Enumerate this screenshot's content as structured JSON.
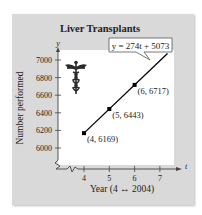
{
  "chart_data": {
    "type": "line",
    "title": "Liver Transplants",
    "xlabel": "Year (4 ↔ 2004)",
    "ylabel": "Number performed",
    "x_axis_var": "t",
    "y_axis_var": "y",
    "x_ticks": [
      "4",
      "5",
      "6",
      "7"
    ],
    "y_ticks": [
      "6000",
      "6200",
      "6400",
      "6600",
      "6800",
      "7000"
    ],
    "xlim": [
      3.1,
      7.5
    ],
    "ylim": [
      5900,
      7150
    ],
    "equation_label": "y = 274t + 5073",
    "series": [
      {
        "name": "Number performed",
        "x": [
          4,
          5,
          6
        ],
        "values": [
          6169,
          6443,
          6717
        ],
        "point_labels": [
          "(4, 6169)",
          "(5, 6443)",
          "(6, 6717)"
        ]
      }
    ],
    "fit_line": {
      "slope": 274,
      "intercept": 5073,
      "x_range": [
        4,
        7.3
      ]
    },
    "grid": false,
    "axis_break_markers": true,
    "decoration": "caduceus-icon",
    "colors": {
      "panel": "#d9d9d9",
      "plot": "#ffffff",
      "line": "#000000"
    }
  }
}
